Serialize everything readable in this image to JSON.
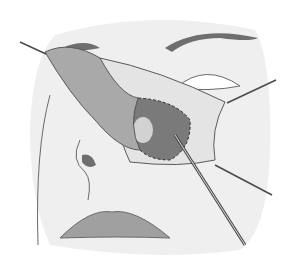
{
  "illustration": {
    "subject": "surgical illustration of lateral nasal flap retracted with hooks and probe",
    "style": "grayscale line drawing",
    "colors": {
      "background": "#ffffff",
      "skin": "#efefef",
      "skin_shadow": "#d6d6d6",
      "outline": "#5a5a5a",
      "flap": "#a9a9a9",
      "flap_dark": "#8a8a8a",
      "cavity": "#7a7a7a",
      "tissue": "#e4e4e4",
      "brow": "#6e6e6e",
      "lips": "#a0a0a0",
      "instrument": "#4a4a4a"
    }
  }
}
